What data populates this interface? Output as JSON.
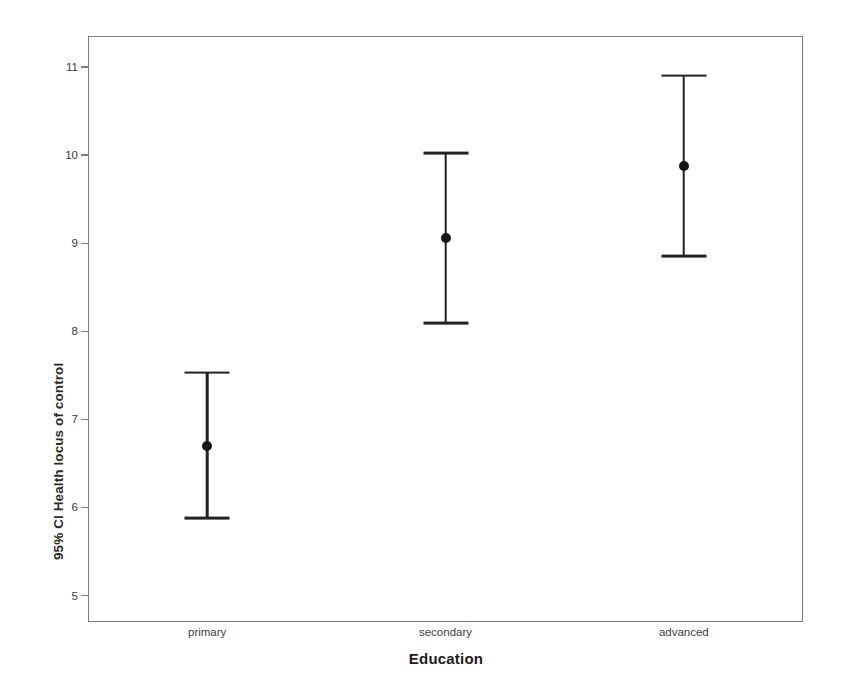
{
  "chart_data": {
    "type": "scatter",
    "title": "",
    "xlabel": "Education",
    "ylabel": "95% CI Health locus of control",
    "categories": [
      "primary",
      "secondary",
      "advanced"
    ],
    "x_tick_labels": [
      "primary",
      "secondary",
      "advanced"
    ],
    "y_tick_labels": [
      "11",
      "10",
      "9",
      "8",
      "7",
      "6",
      "5"
    ],
    "y_ticks": [
      11,
      10,
      9,
      8,
      7,
      6,
      5
    ],
    "ylim": [
      4.7,
      11.35
    ],
    "grid": false,
    "legend": null,
    "error_kind": "95% confidence interval",
    "series": [
      {
        "name": "95% CI Health locus of control",
        "means": [
          6.7,
          9.06,
          9.87
        ],
        "ci_lower": [
          5.88,
          8.09,
          8.85
        ],
        "ci_upper": [
          7.53,
          10.02,
          10.9
        ]
      }
    ],
    "points": [
      {
        "category": "primary",
        "mean": 6.7,
        "ci_lower": 5.88,
        "ci_upper": 7.53
      },
      {
        "category": "secondary",
        "mean": 9.06,
        "ci_lower": 8.09,
        "ci_upper": 10.02
      },
      {
        "category": "advanced",
        "mean": 9.87,
        "ci_lower": 8.85,
        "ci_upper": 10.9
      }
    ],
    "colors": {
      "marker": "#151515",
      "errorbar": "#222222",
      "frame": "#7d7d7d",
      "tick_label": "#3a3a3a",
      "axis_title": "#1d1d1d",
      "background": "#ffffff"
    }
  }
}
